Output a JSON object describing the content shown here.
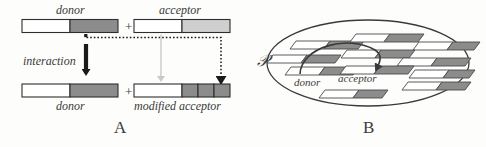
{
  "figure": {
    "caption_panels": [
      "A",
      "B"
    ],
    "background_color": "#fdfdfc",
    "ink_color": "#3a3a3a"
  },
  "panel_a": {
    "letter": "A",
    "top_row": {
      "donor": {
        "label": "donor",
        "segments": [
          {
            "name": "inert-region",
            "fill": "#ffffff"
          },
          {
            "name": "active-region",
            "fill": "#8c8c8c"
          }
        ]
      },
      "plus_sign": "+",
      "acceptor": {
        "label": "acceptor",
        "segments": [
          {
            "name": "inert-region",
            "fill": "#ffffff"
          },
          {
            "name": "target-region",
            "fill": "#cfcfcf"
          }
        ]
      }
    },
    "arrow_label": "interaction",
    "bottom_row": {
      "donor": {
        "label": "donor",
        "segments": [
          {
            "name": "inert-region",
            "fill": "#ffffff"
          },
          {
            "name": "active-region",
            "fill": "#8c8c8c"
          }
        ]
      },
      "plus_sign": "+",
      "modified_acceptor": {
        "label": "modified acceptor",
        "segments": [
          {
            "name": "inert-region",
            "fill": "#ffffff"
          },
          {
            "name": "modified-block-1",
            "fill": "#8c8c8c"
          },
          {
            "name": "modified-block-2",
            "fill": "#8c8c8c"
          },
          {
            "name": "modified-block-3",
            "fill": "#8c8c8c"
          }
        ]
      }
    },
    "arrows": [
      {
        "name": "interaction-arrow",
        "style": "solid-thick",
        "color": "#1a1a1a",
        "direction": "down"
      },
      {
        "name": "acceptor-carryover-arrow",
        "style": "solid-thin",
        "color": "#c9c9c9",
        "direction": "down"
      },
      {
        "name": "donor-transfer-arrow",
        "style": "dotted",
        "color": "#1a1a1a",
        "direction": "down"
      }
    ]
  },
  "panel_b": {
    "letter": "B",
    "population_symbol": "P",
    "donor_label": "donor",
    "acceptor_label": "acceptor",
    "interaction_arrow": {
      "name": "donor-to-acceptor-arc",
      "style": "curved-solid",
      "color": "#3a3a3a"
    },
    "agent_count": 13,
    "agents": [
      {
        "name": "agent",
        "x": 95,
        "y": 42,
        "w": 36,
        "h": 8,
        "split": 0.5
      },
      {
        "name": "agent",
        "x": 150,
        "y": 36,
        "w": 36,
        "h": 8,
        "split": 0.5
      },
      {
        "name": "agent",
        "x": 210,
        "y": 43,
        "w": 36,
        "h": 8,
        "split": 0.5
      },
      {
        "name": "agent",
        "x": 65,
        "y": 58,
        "w": 36,
        "h": 8,
        "split": 0.5
      },
      {
        "name": "agent-donor",
        "x": 95,
        "y": 70,
        "w": 36,
        "h": 8,
        "split": 0.5
      },
      {
        "name": "agent",
        "x": 140,
        "y": 54,
        "w": 36,
        "h": 8,
        "split": 0.5
      },
      {
        "name": "agent-acceptor",
        "x": 152,
        "y": 70,
        "w": 36,
        "h": 8,
        "split": 0.5
      },
      {
        "name": "agent",
        "x": 196,
        "y": 62,
        "w": 36,
        "h": 8,
        "split": 0.5
      },
      {
        "name": "agent",
        "x": 218,
        "y": 74,
        "w": 36,
        "h": 8,
        "split": 0.5
      },
      {
        "name": "agent",
        "x": 208,
        "y": 86,
        "w": 36,
        "h": 8,
        "split": 0.5
      },
      {
        "name": "agent",
        "x": 128,
        "y": 92,
        "w": 36,
        "h": 8,
        "split": 0.5
      },
      {
        "name": "agent",
        "x": 55,
        "y": 48,
        "w": 20,
        "h": 8,
        "split": 0.5
      },
      {
        "name": "agent",
        "x": 238,
        "y": 56,
        "w": 22,
        "h": 8,
        "split": 0.5
      }
    ]
  }
}
